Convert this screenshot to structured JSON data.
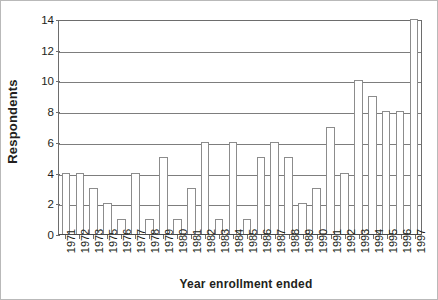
{
  "chart_data": {
    "type": "bar",
    "title": "",
    "xlabel": "Year enrollment ended",
    "ylabel": "Respondents",
    "ylim": [
      0,
      14
    ],
    "ytick_labels": [
      "0",
      "2",
      "4",
      "6",
      "8",
      "10",
      "12",
      "14"
    ],
    "ytick_values": [
      0,
      2,
      4,
      6,
      8,
      10,
      12,
      14
    ],
    "grid": "horizontal",
    "legend": "none",
    "bar_fill": "#ffffff",
    "bar_border": "#8c8c8c",
    "axis_color": "#6d6d6d",
    "text_color": "#231f20",
    "categories": [
      "1971",
      "1972",
      "1973",
      "1975",
      "1976",
      "1977",
      "1978",
      "1979",
      "1980",
      "1981",
      "1982",
      "1983",
      "1984",
      "1985",
      "1986",
      "1987",
      "1988",
      "1989",
      "1990",
      "1991",
      "1992",
      "1993",
      "1994",
      "1995",
      "1996",
      "1997"
    ],
    "values": [
      4,
      4,
      3,
      2,
      1,
      4,
      1,
      5,
      1,
      3,
      6,
      1,
      6,
      1,
      5,
      6,
      5,
      2,
      3,
      7,
      4,
      10,
      9,
      8,
      8,
      14
    ]
  }
}
